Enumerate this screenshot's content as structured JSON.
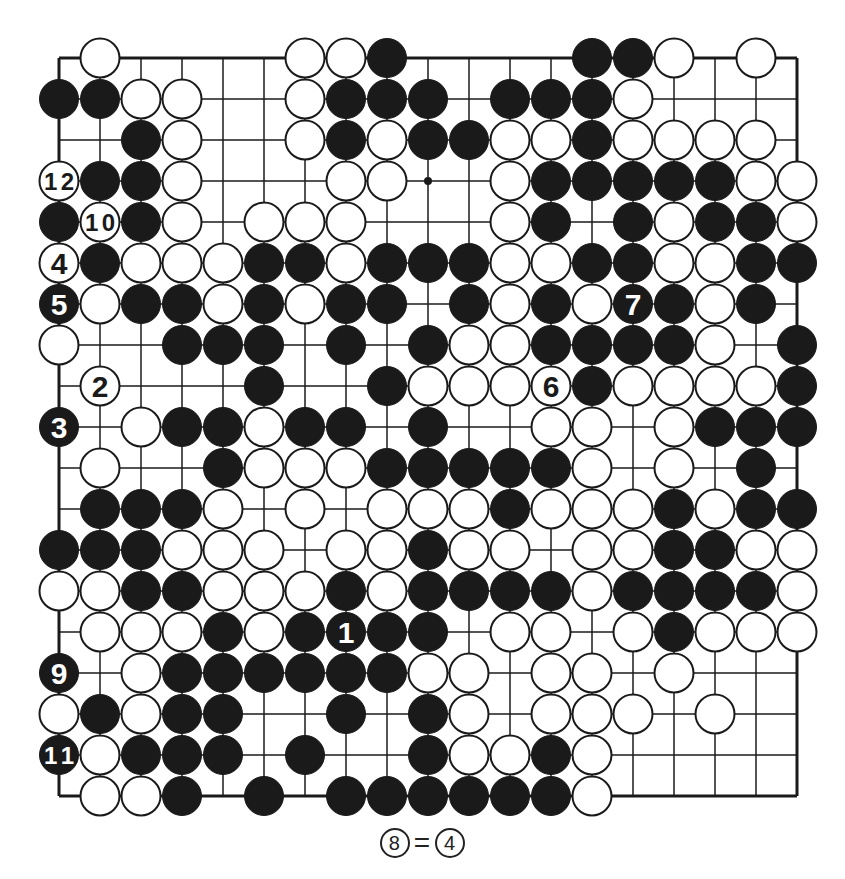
{
  "diagram": {
    "type": "go-board",
    "size": 19,
    "legend": "B = black stone, W = white stone, . = empty intersection",
    "rows": [
      ".W....WWB....BBW.W.",
      "BBWW..WBBB.BBBW....",
      "..BW..WBWBBWWBWWWW.",
      "WBBW...WW..WBBBBBWW",
      "BWBW.WWW...WB.BWBBW",
      "WBWWWBBWBBBWWBBWWBB",
      "BWBBWBWBB.BWBWBBWB.",
      "W..BBB.B.BWWBBBBW.B",
      ".W...B..BWWWWBWWWWB",
      "B.WBBWBB.B..WW.WBBB",
      ".W..BWWWBBBBBW.W.B.",
      ".BBBW.W.WWWBWWWBWBB",
      "BBBWWW.WWBWW.WWBBWW",
      "WWBBWWWBWBBBBWBBBBW",
      ".WWWBWBBBB.WW.WBWWW",
      "B.WBBBBBBWW.WW.W...",
      "WBWBB..B.BW.WWW.W..",
      "BWBBB.B..BWWBW.....",
      ".WWB.B.BBBBBBW....."
    ],
    "numbered_stones": [
      {
        "number": "1",
        "color": "black",
        "row": 14,
        "col": 7
      },
      {
        "number": "2",
        "color": "white",
        "row": 8,
        "col": 1
      },
      {
        "number": "3",
        "color": "black",
        "row": 9,
        "col": 0
      },
      {
        "number": "4",
        "color": "white",
        "row": 5,
        "col": 0
      },
      {
        "number": "5",
        "color": "black",
        "row": 6,
        "col": 0
      },
      {
        "number": "6",
        "color": "white",
        "row": 8,
        "col": 12
      },
      {
        "number": "7",
        "color": "black",
        "row": 6,
        "col": 14
      },
      {
        "number": "9",
        "color": "black",
        "row": 15,
        "col": 0
      },
      {
        "number": "10",
        "color": "white",
        "row": 4,
        "col": 1
      },
      {
        "number": "11",
        "color": "black",
        "row": 17,
        "col": 0
      },
      {
        "number": "12",
        "color": "white",
        "row": 3,
        "col": 0
      }
    ],
    "hoshi_visible": [
      {
        "row": 3,
        "col": 9
      }
    ],
    "colors": {
      "black": "#1a1a1a",
      "white": "#ffffff",
      "line": "#1a1a1a",
      "background": "#ffffff"
    }
  },
  "caption": {
    "left": "8",
    "equals": "=",
    "right": "4"
  }
}
